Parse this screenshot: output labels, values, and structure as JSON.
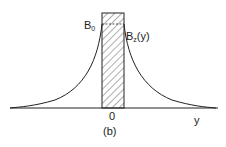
{
  "figure": {
    "caption": "(b)",
    "labels": {
      "peak_base": "B",
      "peak_sub": "0",
      "curve_base": "B",
      "curve_sub": "z",
      "curve_arg": "(y)",
      "origin": "0",
      "axis": "y"
    },
    "colors": {
      "line": "#222222",
      "background": "#ffffff"
    }
  }
}
